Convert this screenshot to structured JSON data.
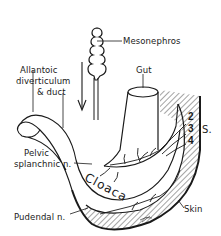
{
  "diagram": {
    "type": "anatomical-embryology-illustration",
    "style": "black ink line drawing with hatching",
    "colors": {
      "ink": "#1a1a1a",
      "background": "#ffffff"
    },
    "labels": {
      "mesonephros": "Mesonephros",
      "allantoic_line1": "Allantoic",
      "allantoic_line2": "diverticulum",
      "allantoic_line3": "& duct",
      "gut": "Gut",
      "sacral_2": "2",
      "sacral_3": "3",
      "sacral_4": "4",
      "sacral_s": "S.",
      "pelvic_line1": "Pelvic",
      "pelvic_line2": "splanchnic n.",
      "cloaca": "Cloaca",
      "skin": "Skin",
      "pudendal": "Pudendal n."
    },
    "annotations": {
      "arrow": "downward-arrow beside mesonephric duct",
      "signature": "artist-mark-bottom"
    }
  }
}
